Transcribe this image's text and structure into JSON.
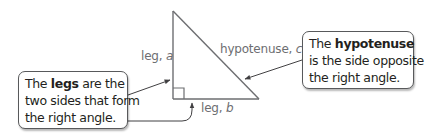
{
  "diagram": {
    "type": "right-triangle-anatomy",
    "colors": {
      "triangle_stroke": "#6d6e71",
      "arrow_stroke": "#414042",
      "label_text": "#6d6e71",
      "callout_text": "#231f20",
      "callout_border": "#58595b"
    },
    "labels": {
      "leg_a": {
        "prefix": "leg, ",
        "variable": "a"
      },
      "leg_b": {
        "prefix": "leg, ",
        "variable": "b"
      },
      "hypotenuse": {
        "prefix": "hypotenuse, ",
        "variable": "c"
      }
    },
    "callouts": {
      "legs": {
        "line1_pre": "The ",
        "line1_bold": "legs",
        "line1_post": " are the",
        "line2": "two sides that form",
        "line3": "the right angle."
      },
      "hypotenuse": {
        "line1_pre": "The ",
        "line1_bold": "hypotenuse",
        "line2": "is the side opposite",
        "line3": "the right angle."
      }
    }
  }
}
